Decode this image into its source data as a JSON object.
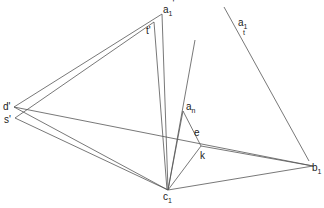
{
  "diagram": {
    "type": "geometric-construction",
    "stroke_color": "#555555",
    "background": "#ffffff",
    "points": {
      "a1_prime": {
        "label": "a",
        "sub": "1",
        "prime": "'",
        "x": 162,
        "y": 14
      },
      "t_prime": {
        "label": "t'",
        "x": 150,
        "y": 28
      },
      "d_prime": {
        "label": "d'",
        "x": 14,
        "y": 107
      },
      "s_prime": {
        "label": "s'",
        "x": 15,
        "y": 118
      },
      "c1": {
        "label": "c",
        "sub": "1",
        "x": 168,
        "y": 190
      },
      "b1": {
        "label": "b",
        "sub": "1",
        "x": 313,
        "y": 166
      },
      "e": {
        "label": "e",
        "x": 200,
        "y": 136
      },
      "k": {
        "label": "k",
        "x": 218,
        "y": 153
      },
      "an": {
        "label": "a",
        "sub": "n",
        "x": 183,
        "y": 111
      },
      "a1_t": {
        "label": "a",
        "sub": "1",
        "extra": "t"
      }
    },
    "labels": {
      "a1_prime_main": "a",
      "a1_prime_sub": "1",
      "a1_prime_mark": "'",
      "t_prime": "t'",
      "d_prime": "d'",
      "s_prime": "s'",
      "c1_main": "c",
      "c1_sub": "1",
      "b1_main": "b",
      "b1_sub": "1",
      "e": "e",
      "k": "k",
      "an_main": "a",
      "an_sub": "n",
      "a1t_main": "a",
      "a1t_sub": "1",
      "a1t_t": "t"
    }
  }
}
